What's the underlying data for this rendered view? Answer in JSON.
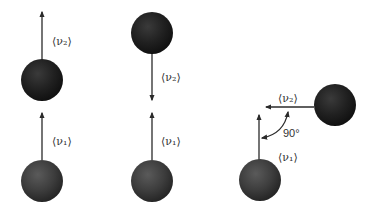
{
  "figure": {
    "colors": {
      "background": "#ffffff",
      "ball_dark": "#1c1c1c",
      "ball_mid": "#3a3a3a",
      "arrow": "#2a2a2a",
      "text": "#333333"
    }
  },
  "panels": [
    {
      "name": "parallel",
      "labels": {
        "v2": "⟨ν₂⟩",
        "v1": "⟨ν₁⟩"
      }
    },
    {
      "name": "antiparallel",
      "labels": {
        "v2": "⟨ν₂⟩",
        "v1": "⟨ν₁⟩"
      }
    },
    {
      "name": "perpendicular",
      "labels": {
        "v2": "⟨ν₂⟩",
        "v1": "⟨ν₁⟩",
        "angle": "90°"
      }
    }
  ]
}
